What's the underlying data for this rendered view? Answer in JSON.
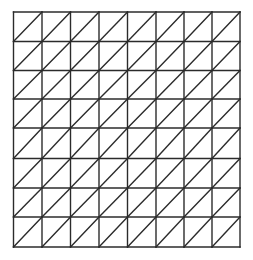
{
  "diagram": {
    "type": "triangulated-grid",
    "columns": 8,
    "rows": 8,
    "diagonal_direction": "bottom-left-to-top-right",
    "x_lines": [
      13.5,
      42,
      70.5,
      99,
      127.5,
      156,
      184,
      212,
      240
    ],
    "y_lines": [
      12,
      41.5,
      70.5,
      99,
      128,
      158.5,
      188,
      217,
      247
    ],
    "stroke_color": "#2b2b2b",
    "stroke_width": 1.4,
    "background": "#ffffff"
  }
}
